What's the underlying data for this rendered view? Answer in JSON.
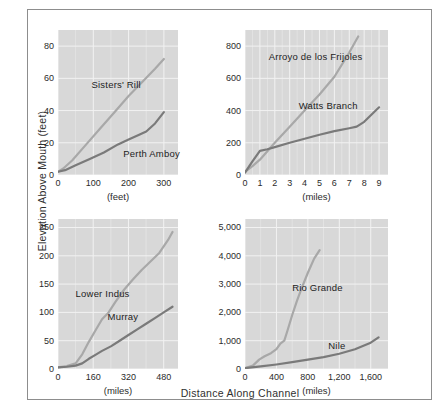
{
  "figure": {
    "ylabel": "Elevation Above Mouth (feet)",
    "xlabel": "Distance Along Channel",
    "background": "#ffffff",
    "plot_background": "#d8d8d8",
    "grid_color": "#f2f2f2",
    "frame_color": "#8d8d8d"
  },
  "colors": {
    "light_series": "#a8a8a8",
    "dark_series": "#7a7a7a",
    "text": "#2b2b2b"
  },
  "chart_data": [
    {
      "id": "panel-top-left",
      "type": "line",
      "title": "",
      "xlabel": "(feet)",
      "ylabel": "",
      "xlim": [
        0,
        340
      ],
      "ylim": [
        0,
        90
      ],
      "xticks": [
        "0",
        "100",
        "200",
        "300"
      ],
      "xtick_values": [
        0,
        100,
        200,
        300
      ],
      "yticks": [
        "0",
        "20",
        "40",
        "60",
        "80"
      ],
      "ytick_values": [
        0,
        20,
        40,
        60,
        80
      ],
      "grid": true,
      "legend_position": "inline-annotation",
      "series": [
        {
          "name": "Sisters' Rill",
          "color": "#a8a8a8",
          "label_x": 95,
          "label_y": 56,
          "x": [
            0,
            15,
            40,
            80,
            120,
            160,
            200,
            240,
            275,
            300
          ],
          "y": [
            2,
            4,
            9,
            19,
            29,
            39,
            49,
            58,
            66,
            72
          ]
        },
        {
          "name": "Perth Amboy",
          "color": "#7a7a7a",
          "label_x": 185,
          "label_y": 13,
          "x": [
            0,
            20,
            50,
            90,
            130,
            170,
            200,
            230,
            250,
            275,
            300
          ],
          "y": [
            2,
            3,
            6,
            10,
            14,
            19,
            22,
            25,
            27,
            32,
            39
          ]
        }
      ]
    },
    {
      "id": "panel-top-right",
      "type": "line",
      "title": "",
      "xlabel": "(miles)",
      "ylabel": "",
      "xlim": [
        0,
        9.6
      ],
      "ylim": [
        0,
        900
      ],
      "xticks": [
        "0",
        "1",
        "2",
        "3",
        "4",
        "5",
        "6",
        "7",
        "8",
        "9"
      ],
      "xtick_values": [
        0,
        1,
        2,
        3,
        4,
        5,
        6,
        7,
        8,
        9
      ],
      "yticks": [
        "0",
        "200",
        "400",
        "600",
        "800"
      ],
      "ytick_values": [
        0,
        200,
        400,
        600,
        800
      ],
      "grid": true,
      "legend_position": "inline-annotation",
      "series": [
        {
          "name": "Arroyo de los Frijoles",
          "color": "#a8a8a8",
          "label_x": 1.6,
          "label_y": 735,
          "x": [
            0,
            0.5,
            1,
            2,
            3,
            4,
            5,
            6,
            7,
            7.6
          ],
          "y": [
            20,
            55,
            95,
            200,
            300,
            400,
            500,
            610,
            760,
            860
          ]
        },
        {
          "name": "Watts Branch",
          "color": "#7a7a7a",
          "label_x": 3.6,
          "label_y": 430,
          "x": [
            0,
            0.5,
            1,
            1.5,
            2,
            3,
            4,
            5,
            6,
            7,
            7.5,
            8,
            8.5,
            9
          ],
          "y": [
            15,
            85,
            150,
            160,
            173,
            200,
            225,
            250,
            272,
            290,
            300,
            330,
            375,
            420
          ]
        }
      ]
    },
    {
      "id": "panel-bottom-left",
      "type": "line",
      "title": "",
      "xlabel": "(miles)",
      "ylabel": "",
      "xlim": [
        0,
        545
      ],
      "ylim": [
        0,
        265
      ],
      "xticks": [
        "0",
        "160",
        "320",
        "480"
      ],
      "xtick_values": [
        0,
        160,
        320,
        480
      ],
      "yticks": [
        "0",
        "50",
        "100",
        "150",
        "200",
        "250"
      ],
      "ytick_values": [
        0,
        50,
        100,
        150,
        200,
        250
      ],
      "grid": true,
      "legend_position": "inline-annotation",
      "series": [
        {
          "name": "Lower Indus",
          "color": "#a8a8a8",
          "label_x": 80,
          "label_y": 133,
          "x": [
            0,
            40,
            80,
            110,
            140,
            170,
            200,
            230,
            260,
            300,
            340,
            380,
            420,
            460,
            500,
            520
          ],
          "y": [
            3,
            5,
            10,
            26,
            48,
            68,
            88,
            100,
            118,
            140,
            158,
            175,
            190,
            205,
            228,
            242
          ]
        },
        {
          "name": "Murray",
          "color": "#7a7a7a",
          "label_x": 225,
          "label_y": 92,
          "x": [
            0,
            40,
            80,
            110,
            140,
            170,
            200,
            240,
            280,
            320,
            360,
            400,
            440,
            480,
            520
          ],
          "y": [
            3,
            4,
            6,
            10,
            18,
            25,
            32,
            40,
            50,
            60,
            70,
            80,
            90,
            100,
            110
          ]
        }
      ]
    },
    {
      "id": "panel-bottom-right",
      "type": "line",
      "title": "",
      "xlabel": "(miles)",
      "ylabel": "",
      "xlim": [
        0,
        1820
      ],
      "ylim": [
        0,
        5300
      ],
      "xticks": [
        "0",
        "400",
        "800",
        "1,200",
        "1,600"
      ],
      "xtick_values": [
        0,
        400,
        800,
        1200,
        1600
      ],
      "yticks": [
        "0",
        "1,000",
        "2,000",
        "3,000",
        "4,000",
        "5,000"
      ],
      "ytick_values": [
        0,
        1000,
        2000,
        3000,
        4000,
        5000
      ],
      "grid": true,
      "legend_position": "inline-annotation",
      "series": [
        {
          "name": "Rio Grande",
          "color": "#a8a8a8",
          "label_x": 600,
          "label_y": 2850,
          "x": [
            0,
            100,
            180,
            250,
            330,
            400,
            450,
            500,
            540,
            600,
            660,
            720,
            800,
            880,
            950
          ],
          "y": [
            30,
            120,
            330,
            450,
            560,
            700,
            900,
            1000,
            1350,
            1900,
            2400,
            2850,
            3400,
            3900,
            4200
          ]
        },
        {
          "name": "Nile",
          "color": "#7a7a7a",
          "label_x": 1060,
          "label_y": 810,
          "x": [
            0,
            200,
            400,
            600,
            800,
            1000,
            1200,
            1400,
            1600,
            1700
          ],
          "y": [
            30,
            90,
            160,
            240,
            330,
            420,
            540,
            700,
            930,
            1120
          ]
        }
      ]
    }
  ]
}
